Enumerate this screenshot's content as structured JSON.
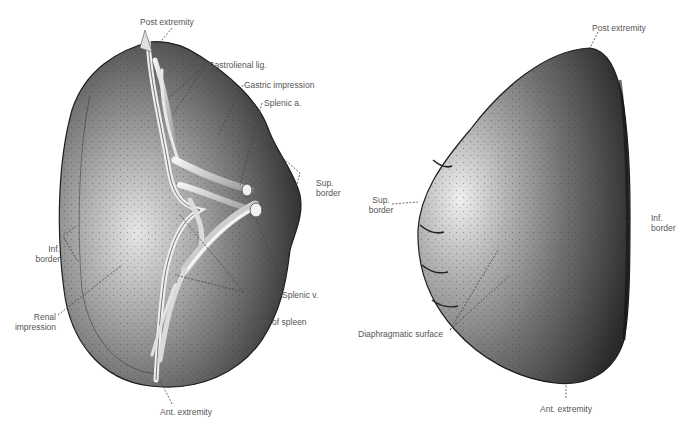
{
  "figure": {
    "left_view": {
      "name": "Visceral surface of spleen",
      "labels": {
        "post_extremity": "Post extremity",
        "gastrolienal_lig": "Gastrolienal lig.",
        "gastric_impression": "Gastric impression",
        "splenic_a": "Splenic a.",
        "sup_border_1": "Sup.",
        "sup_border_2": "border",
        "inf_border_1": "Inf.",
        "inf_border_2": "border",
        "renal_impression_1": "Renal",
        "renal_impression_2": "impression",
        "splenic_v": "Splenic v.",
        "hilum": "Hilum of spleen",
        "ant_extremity": "Ant. extremity"
      }
    },
    "right_view": {
      "name": "Diaphragmatic surface of spleen",
      "labels": {
        "post_extremity": "Post extremity",
        "sup_border_1": "Sup.",
        "sup_border_2": "border",
        "inf_border_1": "Inf.",
        "inf_border_2": "border",
        "diaphragmatic_surface": "Diaphragmatic surface",
        "ant_extremity": "Ant. extremity"
      }
    },
    "colors": {
      "organ_dark": "#3a3a3a",
      "organ_mid": "#7a7a7a",
      "organ_light": "#e8e8e8",
      "vessel": "#d8d8d8",
      "leader_line": "#444444",
      "label_text": "#555555"
    }
  }
}
